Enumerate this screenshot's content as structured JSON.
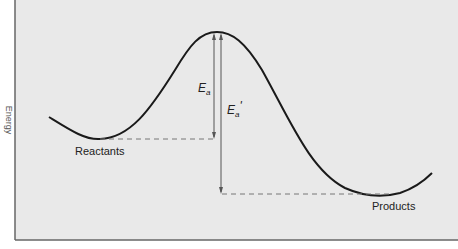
{
  "diagram": {
    "y_axis_label": "Energy",
    "labels": {
      "reactants": "Reactants",
      "products": "Products",
      "ea_main": "E",
      "ea_sub": "a",
      "ea_prime_main": "E",
      "ea_prime_sub": "a",
      "ea_prime_mark": "'"
    },
    "colors": {
      "plot_background": "#e9e9e9",
      "axis": "#666666",
      "curve": "#1a1a1a",
      "arrow": "#555555",
      "dashed": "#777777"
    }
  }
}
